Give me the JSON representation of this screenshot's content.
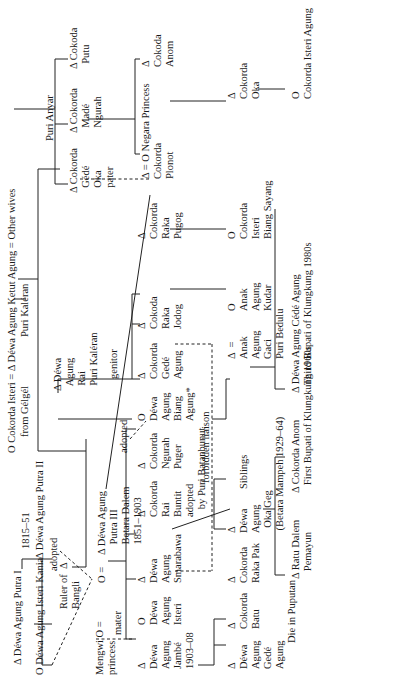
{
  "symbols": {
    "male": "Δ",
    "female": "O",
    "marriage": "="
  },
  "top": {
    "cokorda_isteri": "O Cokorda Isteri",
    "cokorda_isteri_sub": "from Gélgél",
    "eq1": "=",
    "ketut_agung": "Δ Déwa Agung Ketut Agung",
    "ketut_agung_sub": "Puri Kaléran",
    "eq2": "=",
    "other_wives": "Other wives"
  },
  "gen1": {
    "putra_i": "Δ Déwa Agung Putra I",
    "isteri_kania": "O Déwa Agung Isteri Kania",
    "putra_ii": "Δ Déwa Agung Putra II",
    "putra_ii_years": "1815–51",
    "adopted1": "adopted",
    "ruler_bangli": [
      "Ruler of  Δ",
      "Bangli"
    ]
  },
  "gen2": {
    "mengwi": [
      "Mengwi O =",
      "princess"
    ],
    "mater": "mater",
    "female_eq": "O  =",
    "putra_iii": [
      "Δ Déwa Agung",
      "Putra III",
      "Betara Dalem",
      "1851–1903"
    ],
    "genitor": "genitor",
    "adopted2": "adopted",
    "dewa_agung_rai": [
      "Δ Déwa",
      "Agung",
      "Rai",
      "Puri Kaléran"
    ]
  },
  "purianyar": {
    "label": "Puri Anyar",
    "gede_oka": [
      "Δ Cokorda",
      "Gédé",
      "Oka",
      "pater"
    ],
    "made_ngurah": [
      "Δ Cokorda",
      "Madé",
      "Ngurah"
    ],
    "putu": [
      "Δ Cokoda",
      "Putu"
    ]
  },
  "gen3": [
    {
      "name": [
        "Δ",
        "Déwa",
        "Agung",
        "Jambé",
        "1903–08"
      ]
    },
    {
      "name": [
        "O",
        "Déwa",
        "Agung",
        "Isteri"
      ]
    },
    {
      "name": [
        "Δ",
        "Déwa",
        "Agung",
        "Smarabawa"
      ]
    },
    {
      "name": [
        "Δ",
        "Cokorda",
        "Rai",
        "Buntit",
        "adopted",
        "by Puri Batanbunut"
      ]
    },
    {
      "name": [
        "Δ",
        "Cokorda",
        "Ngurah",
        "Puger"
      ]
    },
    {
      "name": [
        "O",
        "Déwa",
        "Agung",
        "Biang",
        "Agung*"
      ]
    },
    {
      "name": [
        "Δ",
        "Cokorda",
        "Gedé",
        "Agung"
      ]
    },
    {
      "name": [
        "Δ",
        "Cokoda",
        "Raka",
        "Jodog"
      ]
    },
    {
      "name": [
        "Δ",
        "Cokorda",
        "Raka",
        "Pugog"
      ]
    },
    {
      "name": [
        "Δ = O Negara Princess",
        "Cokorda",
        "Plonot"
      ]
    },
    {
      "name": [
        "Δ",
        "Cokoda",
        "Anom"
      ]
    }
  ],
  "forbidden": "forbidden liaison",
  "gen4": {
    "batu_gede": [
      "Δ",
      "Déwa",
      "Agung",
      "Gedé",
      "Agung"
    ],
    "batu": [
      "Δ",
      "Cokorda",
      "Batu"
    ],
    "raka_pak": [
      "Δ",
      "Cokorda",
      "Raka Pak"
    ],
    "oka_geg": [
      "Δ",
      "Déwa",
      "Agung",
      "Oka Geg",
      "(Betara Mampeh 1929–64)"
    ],
    "siblings": "Siblings",
    "die_puputan": "Die in Puputan",
    "anak_agung_gaci": [
      "Δ",
      "Anak",
      "Agung",
      "Gaci",
      "Puri Bedulu"
    ],
    "eq": "=",
    "anak_agung_kudar": [
      "O",
      "Anak",
      "Agung",
      "Kudar"
    ],
    "isteri_biang": [
      "O",
      "Cokorda",
      "Isteri",
      "Biang Sayang"
    ],
    "cokorda_oka": [
      "Δ",
      "Cokorda",
      "Oka"
    ]
  },
  "gen5": {
    "ratu_dalem": [
      "Δ Ratu Dalem",
      "Pemayun"
    ],
    "cokorda_anom": [
      "Δ Cokorda Anom",
      "First Bupati of Klungkung 1960s"
    ],
    "cede_agung": [
      "Δ Déwa Agung Cédé Agung",
      "Third Bupati of Klungkung 1980s"
    ],
    "isteri_agung": [
      "O",
      "Cokorda Isteri Agung"
    ]
  }
}
